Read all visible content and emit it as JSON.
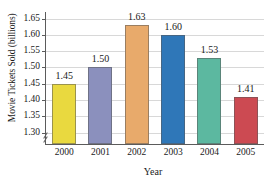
{
  "chart_data": {
    "type": "bar",
    "title": "",
    "xlabel": "Year",
    "ylabel": "Movie Tickets Sold (billions)",
    "categories": [
      "2000",
      "2001",
      "2002",
      "2003",
      "2004",
      "2005"
    ],
    "values": [
      1.45,
      1.5,
      1.63,
      1.6,
      1.53,
      1.41
    ],
    "value_labels": [
      "1.45",
      "1.50",
      "1.63",
      "1.60",
      "1.53",
      "1.41"
    ],
    "bar_colors": [
      "#e9d93f",
      "#8b90bd",
      "#e8aa6b",
      "#2f77b8",
      "#5cb8a0",
      "#cc4a52"
    ],
    "ylim": [
      1.265,
      1.67
    ],
    "yticks": [
      1.3,
      1.35,
      1.4,
      1.45,
      1.5,
      1.55,
      1.6,
      1.65
    ],
    "ytick_labels": [
      "1.30",
      "1.35",
      "1.40",
      "1.45",
      "1.50",
      "1.55",
      "1.60",
      "1.65"
    ],
    "grid": true,
    "legend": "none",
    "axis_break": true,
    "axis_break_position": "below-1.30",
    "grid_color": "#d8d8d8",
    "axis_color": "#5b5b5b",
    "background": "#ffffff"
  }
}
